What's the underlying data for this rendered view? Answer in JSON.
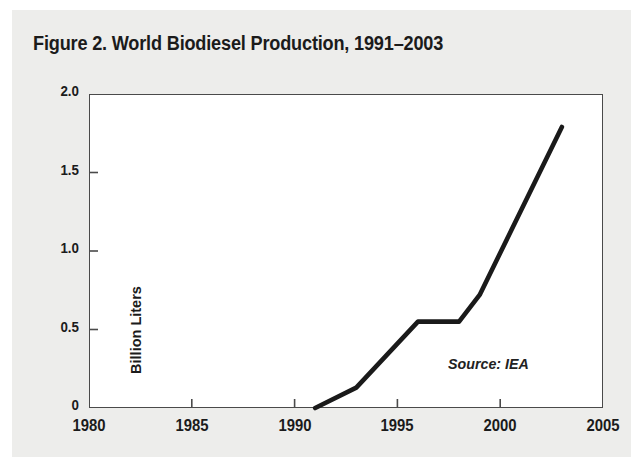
{
  "figure": {
    "title": "Figure 2. World Biodiesel Production, 1991–2003",
    "source_note": "Source: IEA"
  },
  "colors": {
    "page_background": "#ededeb",
    "plot_background": "#ffffff",
    "frame": "#4a4a4a",
    "line": "#1a1a1a",
    "text": "#1b1b1b"
  },
  "chart_data": {
    "type": "line",
    "title": "Figure 2. World Biodiesel Production, 1991–2003",
    "xlabel": "",
    "ylabel": "Billion Liters",
    "xlim": [
      1980,
      2005
    ],
    "ylim": [
      0,
      2.0
    ],
    "xticks": [
      1980,
      1985,
      1990,
      1995,
      2000,
      2005
    ],
    "xtick_labels": [
      "1980",
      "1985",
      "1990",
      "1995",
      "2000",
      "2005"
    ],
    "yticks": [
      0,
      0.5,
      1.0,
      1.5,
      2.0
    ],
    "ytick_labels": [
      "0",
      "0.5",
      "1.0",
      "1.5",
      "2.0"
    ],
    "grid": false,
    "legend": false,
    "annotations": [
      "Source: IEA"
    ],
    "series": [
      {
        "name": "World Biodiesel Production",
        "x": [
          1991,
          1993,
          1996,
          1998,
          1999,
          2003
        ],
        "values": [
          0.0,
          0.13,
          0.55,
          0.55,
          0.72,
          1.79
        ]
      }
    ]
  }
}
